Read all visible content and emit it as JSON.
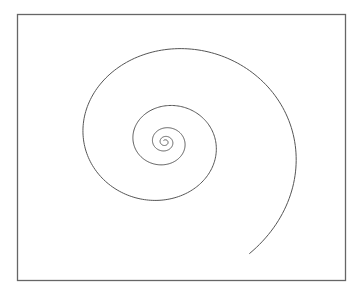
{
  "figure": {
    "shape": "spiral",
    "turns": 4.5,
    "direction": "clockwise-outward",
    "stroke_color": "#555555",
    "frame_color": "#666666",
    "background": "#ffffff"
  }
}
